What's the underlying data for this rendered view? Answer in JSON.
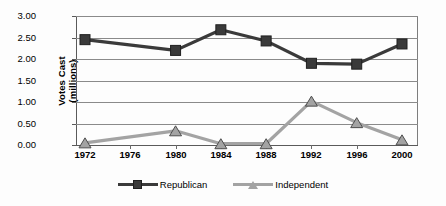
{
  "chart_data": {
    "type": "line",
    "title": "",
    "subtitle": "",
    "xlabel": "",
    "ylabel": "Votes Cast (millions)",
    "ylabel_lines": [
      "Votes Cast",
      "(millions)"
    ],
    "categories": [
      "1972",
      "1976",
      "1980",
      "1984",
      "1988",
      "1992",
      "1996",
      "2000"
    ],
    "x": [
      1972,
      1976,
      1980,
      1984,
      1988,
      1992,
      1996,
      2000
    ],
    "xlim": [
      1972,
      2000
    ],
    "ylim": [
      0.0,
      3.0
    ],
    "ytick_labels": [
      "3.00",
      "2.50",
      "2.00",
      "1.50",
      "1.00",
      "0.50",
      "0.00"
    ],
    "ytick_values": [
      3.0,
      2.5,
      2.0,
      1.5,
      1.0,
      0.5,
      0.0
    ],
    "grid": "horizontal",
    "legend_position": "bottom",
    "series": [
      {
        "name": "Republican",
        "color": "#3a3a3a",
        "marker": "square",
        "values": [
          2.45,
          null,
          2.2,
          2.68,
          2.42,
          1.9,
          1.88,
          2.35
        ]
      },
      {
        "name": "Independent",
        "color": "#a3a3a3",
        "marker": "triangle",
        "values": [
          0.05,
          null,
          0.33,
          0.03,
          0.03,
          1.02,
          0.52,
          0.12
        ]
      }
    ]
  },
  "legend": {
    "items": [
      {
        "label": "Republican",
        "color": "#3a3a3a",
        "marker": "square-marker-icon"
      },
      {
        "label": "Independent",
        "color": "#a3a3a3",
        "marker": "triangle-marker-icon"
      }
    ]
  },
  "colors": {
    "republican": "#3a3a3a",
    "independent": "#a3a3a3",
    "gridline": "#8a8a8a",
    "axis": "#5a5a5a",
    "background": "#fdfdfd",
    "text": "#000000"
  }
}
